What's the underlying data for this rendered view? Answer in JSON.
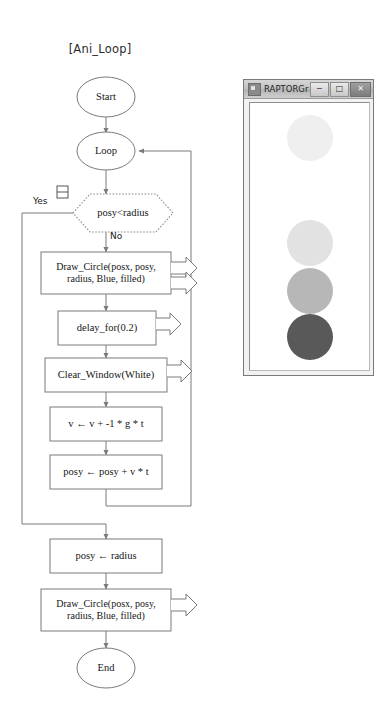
{
  "chart": {
    "title": "[Ani_Loop]",
    "nodes": {
      "start": "Start",
      "loop": "Loop",
      "decision": "posy<radius",
      "draw_circle_in_loop": "Draw_Circle(posx,  posy,\nradius,  Blue,  filled)",
      "delay": "delay_for(0.2)",
      "clear_window": "Clear_Window(White)",
      "velocity_update": "v ← v +   -1 * g * t",
      "position_update": "posy ← posy + v * t",
      "reset_posy": "posy ← radius",
      "draw_circle_final": "Draw_Circle(posx,  posy,\nradius,  Blue,  filled)",
      "end": "End"
    },
    "edge_labels": {
      "yes": "Yes",
      "no": "No"
    },
    "colors": {
      "stroke": "#7a7a7a",
      "text": "#151515",
      "dotted": "#8c8c8c"
    }
  },
  "raptor_window": {
    "title": "RAPTORGra...",
    "icon": "app-icon",
    "buttons": {
      "minimize": "─",
      "maximize": "□",
      "close": "✕"
    },
    "balls": [
      {
        "name": "ball-trail-1",
        "cx": 60,
        "cy": 35,
        "r": 23,
        "color": "#efefef"
      },
      {
        "name": "ball-trail-2",
        "cx": 60,
        "cy": 140,
        "r": 23,
        "color": "#e2e2e2"
      },
      {
        "name": "ball-trail-3",
        "cx": 60,
        "cy": 188,
        "r": 23,
        "color": "#b7b7b7"
      },
      {
        "name": "ball-current",
        "cx": 60,
        "cy": 234,
        "r": 23,
        "color": "#595959"
      }
    ]
  }
}
